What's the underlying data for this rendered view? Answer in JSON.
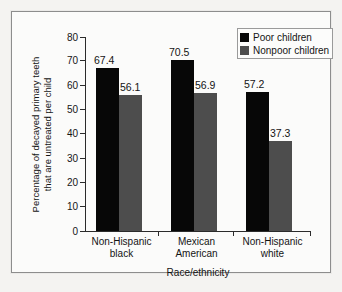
{
  "chart_data": {
    "type": "bar",
    "title": "",
    "xlabel": "Race/ethnicity",
    "ylabel": "Percentage of decayed primary teeth that are untreated per child",
    "ylabel_lines": [
      "Percentage of decayed primary teeth",
      "that are untreated per child"
    ],
    "categories": [
      "Non-Hispanic black",
      "Mexican American",
      "Non-Hispanic white"
    ],
    "category_lines": [
      [
        "Non-Hispanic",
        "black"
      ],
      [
        "Mexican",
        "American"
      ],
      [
        "Non-Hispanic",
        "white"
      ]
    ],
    "series": [
      {
        "name": "Poor children",
        "values": [
          67.4,
          70.5,
          57.2
        ],
        "color": "#070707"
      },
      {
        "name": "Nonpoor children",
        "values": [
          56.1,
          56.9,
          37.3
        ],
        "color": "#4d4d4d"
      }
    ],
    "ylim": [
      0,
      80
    ],
    "ytick_labels": [
      "0",
      "10",
      "20",
      "30",
      "40",
      "50",
      "60",
      "70",
      "80"
    ],
    "ytick_values": [
      0,
      10,
      20,
      30,
      40,
      50,
      60,
      70,
      80
    ],
    "data_labels": [
      "67.4",
      "56.1",
      "70.5",
      "56.9",
      "57.2",
      "37.3"
    ],
    "grid": false,
    "legend_position": "top-right"
  },
  "legend": {
    "entries": [
      {
        "label": "Poor children",
        "swatch": "black-square-swatch"
      },
      {
        "label": "Nonpoor children",
        "swatch": "gray-square-swatch"
      }
    ]
  }
}
